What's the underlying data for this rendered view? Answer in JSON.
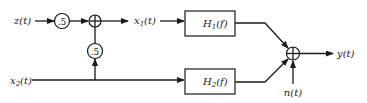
{
  "diagram": {
    "type": "block-diagram",
    "inputs": {
      "z": "z(t)",
      "x2": "x2(t)"
    },
    "gains": {
      "z_gain": ".5",
      "x2_gain": ".5"
    },
    "intermediate": {
      "x1": "x1(t)"
    },
    "blocks": {
      "h1": "H1(f)",
      "h2": "H2(f)"
    },
    "noise": "n(t)",
    "output": "y(t)",
    "colors": {
      "stroke": "#1a1a1a",
      "background": "#ffffff"
    }
  },
  "labels": {
    "z_base": "z(t)",
    "x1_base": "x",
    "x1_sub": "1",
    "x1_tail": "(t)",
    "x2_base": "x",
    "x2_sub": "2",
    "x2_tail": "(t)",
    "h1_base": "H",
    "h1_sub": "1",
    "h1_tail": "(f)",
    "h2_base": "H",
    "h2_sub": "2",
    "h2_tail": "(f)",
    "n": "n(t)",
    "y": "y(t)",
    "gain_top": ".5",
    "gain_vertical": ".5"
  }
}
